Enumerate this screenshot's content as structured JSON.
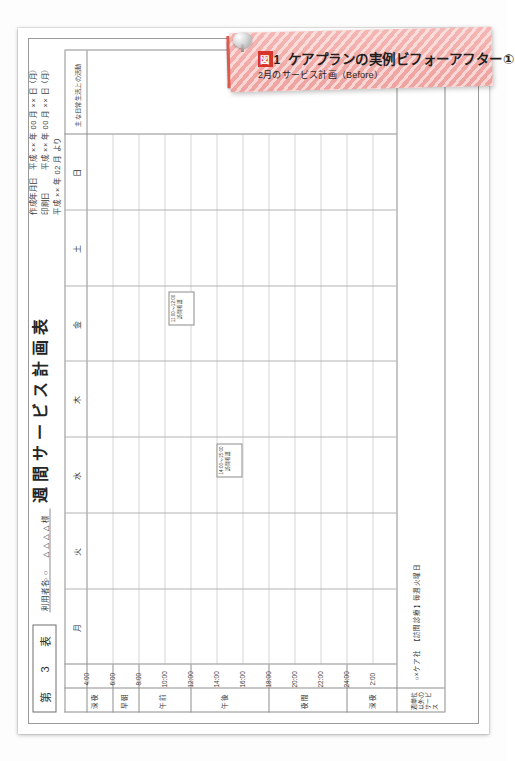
{
  "banner": {
    "fig_badge": "図",
    "fig_number": "1",
    "title": "ケアプランの実例ビフォーアフター①",
    "subtitle": "2月のサービス計画（Before）",
    "pin_icon": "push-pin-icon",
    "accent_color": "#d7352c",
    "background_color": "#f2aaa7"
  },
  "form": {
    "form_no_label": "第",
    "form_no_number": "3",
    "form_no_unit": "表",
    "title": "週間サービス計画表",
    "user_name_label": "利用者名",
    "user_name_value": "○○　△△△△",
    "user_name_suffix": "様",
    "meta": [
      "作成年月日　平成 ×× 年 00 月 ×× 日（月）",
      "印刷日　　　平成 ×× 年 00 月 ×× 日（月）",
      "平成 ×× 年 02 月 より"
    ],
    "day_headers": [
      "月",
      "火",
      "水",
      "木",
      "金",
      "土",
      "日",
      "主な日常生活上の活動"
    ],
    "time_labels": [
      "4:00",
      "6:00",
      "8:00",
      "10:00",
      "12:00",
      "14:00",
      "16:00",
      "18:00",
      "20:00",
      "22:00",
      "24:00",
      "2:00"
    ],
    "period_labels": [
      "深夜",
      "早朝",
      "午前",
      "午後",
      "夜間",
      "深夜"
    ],
    "bottom_row_label": "週単位以外のサービス",
    "bottom_row_value": "○×ケア社　【訪問診療】毎週火曜日",
    "entries": [
      {
        "day": "水",
        "time": "14:00〜15:00",
        "text": "訪問看護"
      },
      {
        "day": "金",
        "time": "11:00〜12:00",
        "text": "訪問看護"
      }
    ]
  }
}
